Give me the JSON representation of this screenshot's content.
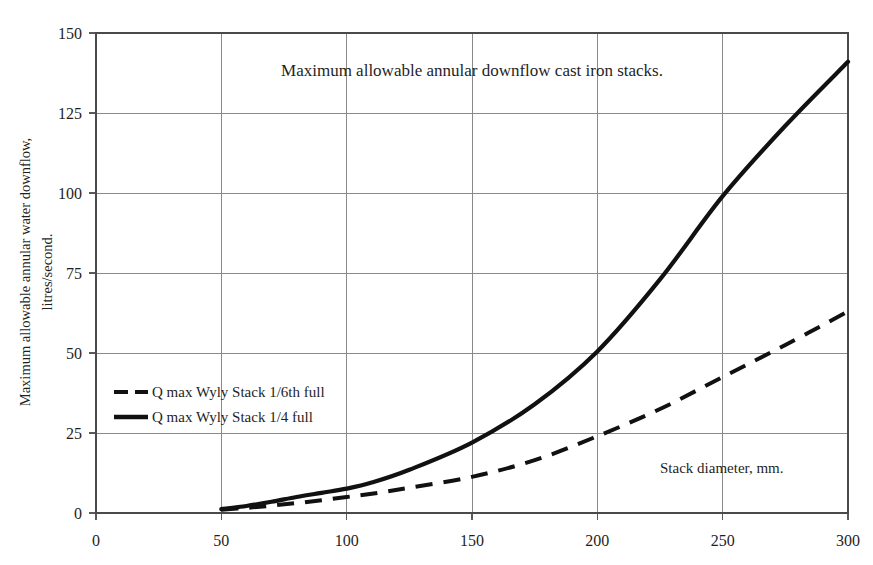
{
  "chart_data": {
    "type": "line",
    "title": "Maximum allowable annular downflow cast iron stacks.",
    "xlabel": "Stack diameter, mm.",
    "ylabel": "Maximum allowable annular water downflow, litres/second.",
    "ylabel_line1": "Maximum allowable annular water downflow,",
    "ylabel_line2": "litres/second.",
    "xlim": [
      0,
      300
    ],
    "ylim": [
      0,
      150
    ],
    "xticks": [
      0,
      50,
      100,
      150,
      200,
      250,
      300
    ],
    "yticks": [
      0,
      25,
      50,
      75,
      100,
      125,
      150
    ],
    "xtick_labels": [
      "0",
      "50",
      "100",
      "150",
      "200",
      "250",
      "300"
    ],
    "ytick_labels": [
      "0",
      "25",
      "50",
      "75",
      "100",
      "125",
      "150"
    ],
    "grid": true,
    "legend_position": "inner-left",
    "line_color": "#111111",
    "grid_color": "#8a8a8a",
    "frame_color": "#4a4a4a",
    "series": [
      {
        "name": "Q max Wyly Stack 1/6th full",
        "style": "dashed",
        "x": [
          50,
          60,
          70,
          80,
          90,
          100,
          110,
          125,
          150,
          175,
          200,
          225,
          250,
          275,
          300
        ],
        "values": [
          1.0,
          1.6,
          2.3,
          3.1,
          4.0,
          5.0,
          6.0,
          7.9,
          11.3,
          16.5,
          24.0,
          32.5,
          42.5,
          52.5,
          63.0
        ]
      },
      {
        "name": "Q max Wyly Stack 1/4 full",
        "style": "solid",
        "x": [
          50,
          60,
          70,
          80,
          90,
          100,
          110,
          125,
          150,
          175,
          200,
          225,
          250,
          275,
          300
        ],
        "values": [
          1.2,
          2.2,
          3.5,
          5.0,
          6.3,
          7.6,
          9.5,
          13.5,
          22.0,
          34.0,
          50.5,
          73.0,
          99.0,
          121.0,
          141.0
        ]
      }
    ]
  },
  "legend": {
    "items": [
      {
        "label": "Q max Wyly Stack 1/6th full",
        "style": "dashed"
      },
      {
        "label": "Q max Wyly Stack 1/4 full",
        "style": "solid"
      }
    ]
  }
}
